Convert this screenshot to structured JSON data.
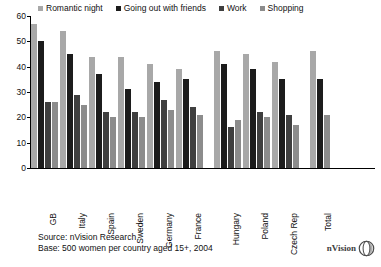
{
  "chart_data": {
    "type": "bar",
    "title": "",
    "xlabel": "",
    "ylabel": "",
    "ylim": [
      0,
      60
    ],
    "yticks": [
      0,
      10,
      20,
      30,
      40,
      50,
      60
    ],
    "grid": false,
    "legend_position": "top",
    "categories": [
      "GB",
      "Italy",
      "Spain",
      "Sweden",
      "Germany",
      "France",
      "Hungary",
      "Poland",
      "Czech Rep",
      "Total"
    ],
    "series": [
      {
        "name": "Romantic night",
        "color": "#a8a8a8",
        "values": [
          57,
          54,
          44,
          44,
          41,
          39,
          46,
          45,
          42,
          46
        ]
      },
      {
        "name": "Going out with friends",
        "color": "#1c1c1c",
        "values": [
          50,
          45,
          37,
          31,
          34,
          35,
          41,
          39,
          35,
          35
        ]
      },
      {
        "name": "Work",
        "color": "#3f3f3f",
        "values": [
          26,
          29,
          22,
          22,
          27,
          24,
          16,
          22,
          21,
          null
        ]
      },
      {
        "name": "Shopping",
        "color": "#8c8c8c",
        "values": [
          26,
          25,
          20,
          20,
          23,
          21,
          19,
          20,
          17,
          21
        ]
      }
    ],
    "group_gaps_after": [
      "France",
      "Czech Rep"
    ],
    "source_note": "Source: nVision Research",
    "base_note": "Base: 500 women per country aged 15+, 2004"
  },
  "legend": {
    "items": [
      {
        "label": "Romantic night",
        "color": "#a8a8a8"
      },
      {
        "label": "Going out with friends",
        "color": "#1c1c1c"
      },
      {
        "label": "Work",
        "color": "#3f3f3f"
      },
      {
        "label": "Shopping",
        "color": "#8c8c8c"
      }
    ]
  },
  "footer": {
    "source": "Source: nVision Research",
    "base": "Base: 500 women per country aged 15+, 2004"
  },
  "logo": {
    "text": "nVision",
    "mark": "sphere-icon"
  }
}
